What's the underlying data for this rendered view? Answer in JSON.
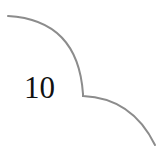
{
  "page": {
    "number": "10"
  },
  "ornament": {
    "stroke_color": "#8c8c8c",
    "stroke_width": 2
  }
}
